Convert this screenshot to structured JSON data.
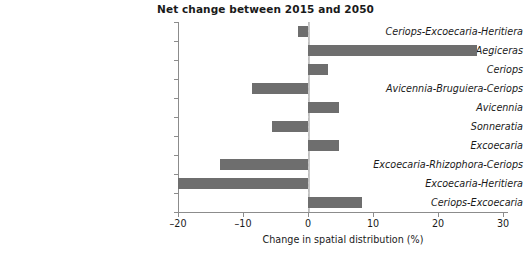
{
  "chart_data": {
    "type": "bar",
    "orientation": "horizontal",
    "title": "Net change between 2015 and 2050",
    "xlabel": "Change in spatial distribution (%)",
    "ylabel": "",
    "xlim": [
      -20,
      30
    ],
    "xticks": [
      -20,
      -10,
      0,
      10,
      20,
      30
    ],
    "xtick_labels": [
      "–20",
      "–10",
      "0",
      "10",
      "20",
      "30"
    ],
    "grid": false,
    "legend": null,
    "bar_color": "#6e6e6e",
    "axis_color": "#8c8c8c",
    "zero_line": 0,
    "categories": [
      "Ceriops-Excoecaria-Heritiera",
      "Phoenix-Xylocarpus-Aegiceras",
      "Ceriops",
      "Avicennia-Bruguiera-Ceriops",
      "Avicennia",
      "Sonneratia",
      "Excoecaria",
      "Excoecaria-Rhizophora-Ceriops",
      "Excoecaria-Heritiera",
      "Ceriops-Excoecaria"
    ],
    "values": [
      -1.5,
      26.0,
      3.1,
      -8.6,
      4.8,
      -5.5,
      4.8,
      -13.5,
      -20.0,
      8.3
    ]
  }
}
